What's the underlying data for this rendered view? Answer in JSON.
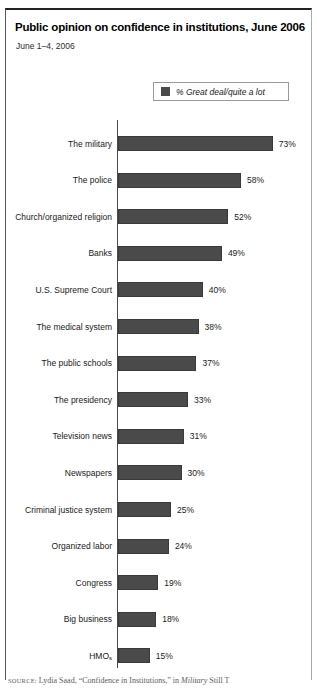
{
  "figure": {
    "title": "Public opinion on confidence in institutions, June 2006",
    "subtitle": "June 1–4, 2006",
    "legend_label": "% Great deal/quite a lot",
    "legend_swatch_color": "#4a4a4a",
    "source_prefix": "SOURCE:",
    "source_text": " Lydia Saad, “Confidence in Institutions,” in ",
    "source_italic": "Military",
    "source_tail": " Still T"
  },
  "chart_data": {
    "type": "bar",
    "orientation": "horizontal",
    "title": "Public opinion on confidence in institutions, June 2006",
    "subtitle": "June 1–4, 2006",
    "xlabel": "",
    "ylabel": "",
    "xlim": [
      0,
      80
    ],
    "grid": false,
    "legend_position": "top-right",
    "series": [
      {
        "name": "% Great deal/quite a lot",
        "color": "#4a4a4a",
        "values": [
          73,
          58,
          52,
          49,
          40,
          38,
          37,
          33,
          31,
          30,
          25,
          24,
          19,
          18,
          15
        ]
      }
    ],
    "categories": [
      "The military",
      "The police",
      "Church/organized religion",
      "Banks",
      "U.S. Supreme Court",
      "The medical system",
      "The public schools",
      "The presidency",
      "Television news",
      "Newspapers",
      "Criminal justice system",
      "Organized labor",
      "Congress",
      "Big business",
      "HMOs"
    ],
    "data_labels": [
      "73%",
      "58%",
      "52%",
      "49%",
      "40%",
      "38%",
      "37%",
      "33%",
      "31%",
      "30%",
      "25%",
      "24%",
      "19%",
      "18%",
      "15%"
    ]
  }
}
